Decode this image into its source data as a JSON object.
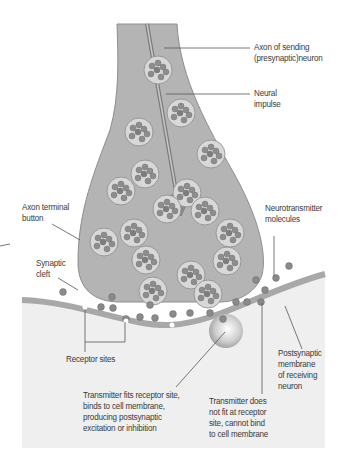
{
  "diagram": {
    "colors": {
      "background": "#ffffff",
      "postsynaptic_region": "#efefef",
      "axon_fill": "#b4b4b4",
      "axon_outline": "#8e8e8e",
      "membrane": "#a8a8a8",
      "vesicle_fill": "#d6d6d6",
      "molecule_fill": "#8a8a8a",
      "label_text": "#3a3a3a",
      "leader_line": "#555555"
    },
    "labels": {
      "axon_sending": "Axon of sending\n(presynaptic)neuron",
      "neural_impulse": "Neural\nimpulse",
      "axon_terminal_button": "Axon terminal\nbutton",
      "neurotransmitter_molecules": "Neurotransmitter\nmolecules",
      "synaptic_cleft": "Synaptic\ncleft",
      "receptor_sites": "Receptor sites",
      "postsynaptic_membrane": "Postsynaptic\nmembrane\nof receiving\nneuron",
      "transmitter_fits": "Transmitter fits receptor site,\nbinds to cell membrane,\nproducing postsynaptic\nexcitation or inhibition",
      "transmitter_not_fit": "Transmitter does\nnot fit at receptor\nsite, cannot bind\nto cell membrane"
    }
  }
}
